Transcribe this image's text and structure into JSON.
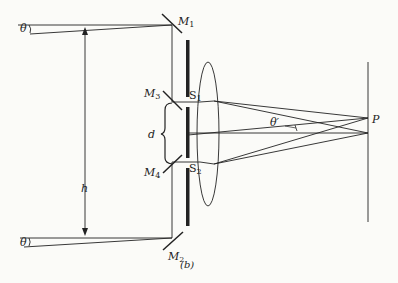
{
  "figure": {
    "caption": "(b)",
    "colors": {
      "ink": "#222222",
      "background": "#fbfbf8"
    }
  },
  "labels": {
    "theta_top": "θ",
    "theta_bottom": "θ",
    "h": "h",
    "d": "d",
    "M1": "M",
    "M1_sub": "1",
    "M2": "M",
    "M2_sub": "2",
    "M3": "M",
    "M3_sub": "3",
    "M4": "M",
    "M4_sub": "4",
    "S1": "S",
    "S1_sub": "1",
    "S2": "S",
    "S2_sub": "2",
    "theta_prime": "θ′",
    "P": "P"
  }
}
